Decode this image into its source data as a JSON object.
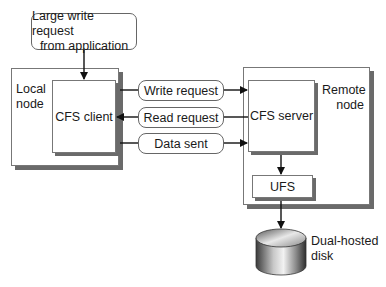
{
  "diagram": {
    "source_box": {
      "line1": "Large write request",
      "line2": "from application"
    },
    "local_node": {
      "line1": "Local",
      "line2": "node",
      "client_label": "CFS client"
    },
    "remote_node": {
      "line1": "Remote",
      "line2": "node",
      "server_label": "CFS server",
      "ufs_label": "UFS"
    },
    "messages": [
      {
        "label": "Write request",
        "direction": "to-server"
      },
      {
        "label": "Read request",
        "direction": "to-client"
      },
      {
        "label": "Data sent",
        "direction": "to-server"
      }
    ],
    "disk": {
      "line1": "Dual-hosted",
      "line2": "disk"
    },
    "colors": {
      "stroke": "#111111",
      "shadow": "#6a6a6a",
      "border": "#777777"
    }
  }
}
